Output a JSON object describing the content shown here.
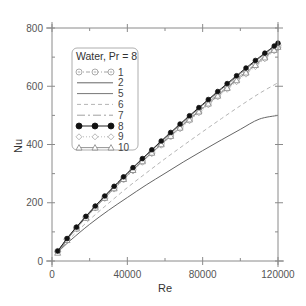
{
  "chart_data": {
    "type": "line",
    "title": "",
    "xlabel": "Re",
    "ylabel": "Nu",
    "xlim": [
      0,
      120000
    ],
    "ylim": [
      0,
      800
    ],
    "xticks": [
      0,
      40000,
      80000,
      120000
    ],
    "xtick_labels": [
      "0",
      "40000",
      "80000",
      "120000"
    ],
    "xminor_ticks": [
      20000,
      60000,
      100000
    ],
    "yticks": [
      0,
      200,
      400,
      600,
      800
    ],
    "ytick_labels": [
      "0",
      "200",
      "400",
      "600",
      "800"
    ],
    "yminor_ticks": [
      100,
      300,
      500,
      700
    ],
    "grid": false,
    "legend": {
      "title": "Water, Pr = 8",
      "position": "upper left",
      "entries": [
        "1",
        "2",
        "5",
        "6",
        "7",
        "8",
        "9",
        "10"
      ]
    },
    "x": [
      3000,
      10000,
      20000,
      30000,
      40000,
      50000,
      60000,
      70000,
      80000,
      90000,
      100000,
      110000,
      120000
    ],
    "series": [
      {
        "name": "1",
        "style": "dash-dot, open circle with dot marker",
        "values": [
          33,
          92,
          165,
          232,
          296,
          356,
          415,
          472,
          528,
          583,
          636,
          688,
          740
        ]
      },
      {
        "name": "2",
        "style": "solid thin line",
        "values": [
          30,
          72,
          126,
          174,
          218,
          261,
          301,
          341,
          379,
          416,
          452,
          487,
          500
        ]
      },
      {
        "name": "5",
        "style": "solid line",
        "values": [
          33,
          93,
          167,
          235,
          300,
          362,
          421,
          479,
          535,
          590,
          643,
          696,
          745
        ]
      },
      {
        "name": "6",
        "style": "dashed light gray",
        "values": [
          31,
          80,
          142,
          198,
          252,
          302,
          351,
          398,
          444,
          489,
          533,
          575,
          612
        ]
      },
      {
        "name": "7",
        "style": "long-dash short-dash",
        "values": [
          32,
          91,
          164,
          231,
          295,
          355,
          414,
          471,
          527,
          581,
          634,
          686,
          738
        ]
      },
      {
        "name": "8",
        "style": "solid with filled black circles",
        "values": [
          34,
          94,
          168,
          237,
          302,
          364,
          424,
          482,
          538,
          593,
          647,
          699,
          748
        ]
      },
      {
        "name": "9",
        "style": "dotted with open diamonds",
        "values": [
          32,
          90,
          162,
          228,
          291,
          351,
          409,
          465,
          520,
          574,
          626,
          678,
          732
        ]
      },
      {
        "name": "10",
        "style": "solid with open triangles",
        "values": [
          28,
          89,
          163,
          230,
          294,
          354,
          412,
          469,
          524,
          578,
          631,
          683,
          735
        ]
      }
    ]
  }
}
